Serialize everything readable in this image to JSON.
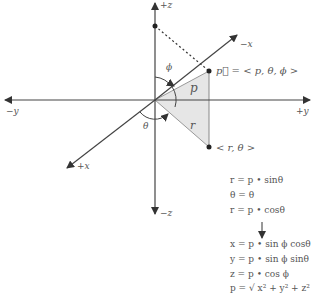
{
  "diagram": {
    "type": "spherical-coordinates",
    "axes": {
      "pos_z": "+z",
      "neg_z_bottom": "−z",
      "neg_x": "−x",
      "pos_x": "+x",
      "neg_y": "−y",
      "pos_y": "+y"
    },
    "angles": {
      "phi": "ϕ",
      "theta": "θ"
    },
    "segments": {
      "p": "p",
      "r": "r"
    },
    "point_p_label": "p⃗ = < p, θ, ϕ >",
    "point_r_label": "< r, θ >",
    "colors": {
      "line": "#444444",
      "fill": "#e6e6e6",
      "text": "#555555"
    }
  },
  "equations": {
    "cylindrical": [
      "r = p • sinθ",
      "θ = θ",
      "r = p • cosθ"
    ],
    "arrow": "↓",
    "cartesian": [
      "x = p • sin ϕ cosθ",
      "y = p • sin ϕ sinθ",
      "z = p • cos ϕ",
      "p = √ x² + y² + z²"
    ]
  }
}
